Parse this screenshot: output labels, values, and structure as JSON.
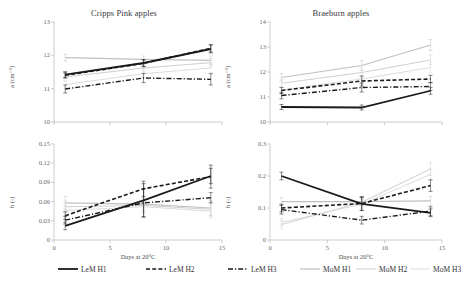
{
  "figure": {
    "background": "#ffffff",
    "colors": {
      "dark": "#1a1a1a",
      "light_gray": "#c8c8c8",
      "mid_gray": "#b4b4b4",
      "pale_gray": "#d8d8d8",
      "axis": "#bfbfbf",
      "text": "#3a3a3a"
    }
  },
  "legend": {
    "position": "bottom",
    "items": [
      {
        "label": "LeM H1",
        "style": "solid",
        "color": "#1a1a1a",
        "width": 1.8
      },
      {
        "label": "LeM H2",
        "style": "dashed",
        "color": "#1a1a1a",
        "width": 1.6
      },
      {
        "label": "LeM H3",
        "style": "dashdot",
        "color": "#1a1a1a",
        "width": 1.4
      },
      {
        "label": "MoM H1",
        "style": "solid",
        "color": "#c0c0c0",
        "width": 1.2
      },
      {
        "label": "MoM H2",
        "style": "solid",
        "color": "#cfcfcf",
        "width": 1.0
      },
      {
        "label": "MoM H3",
        "style": "solid",
        "color": "#dcdcdc",
        "width": 1.0
      }
    ]
  },
  "chart_data": [
    {
      "id": "cripps-pink-a",
      "type": "line",
      "title": "Cripps Pink apples",
      "xlabel": "",
      "ylabel": "a (cm⁻¹)",
      "x": [
        1,
        8,
        14
      ],
      "xlim": [
        0,
        15
      ],
      "ylim": [
        10,
        13
      ],
      "xticks": [
        0,
        5,
        10,
        15
      ],
      "yticks": [
        10,
        11,
        12,
        13
      ],
      "xticklabels": [
        "0",
        "5",
        "10",
        "15"
      ],
      "yticklabels": [
        "10",
        "11",
        "12",
        "13"
      ],
      "show_xticklabels": false,
      "grid": false,
      "series": [
        {
          "name": "LeM H1",
          "style": "solid",
          "color": "#1a1a1a",
          "width": 1.8,
          "values": [
            11.42,
            11.77,
            12.19
          ],
          "errors": [
            0.09,
            0.1,
            0.12
          ]
        },
        {
          "name": "LeM H2",
          "style": "dashed",
          "color": "#1a1a1a",
          "width": 1.6,
          "values": [
            11.4,
            11.76,
            12.21
          ],
          "errors": [
            0.08,
            0.1,
            0.11
          ]
        },
        {
          "name": "LeM H3",
          "style": "dashdot",
          "color": "#1a1a1a",
          "width": 1.4,
          "values": [
            10.99,
            11.32,
            11.28
          ],
          "errors": [
            0.12,
            0.14,
            0.17
          ]
        },
        {
          "name": "MoM H1",
          "style": "solid",
          "color": "#c0c0c0",
          "width": 1.2,
          "values": [
            11.93,
            11.88,
            11.85
          ],
          "errors": [
            0.1,
            0.1,
            0.13
          ]
        },
        {
          "name": "MoM H2",
          "style": "solid",
          "color": "#cfcfcf",
          "width": 1.0,
          "values": [
            11.35,
            11.62,
            11.78
          ],
          "errors": [
            0.1,
            0.1,
            0.12
          ]
        },
        {
          "name": "MoM H3",
          "style": "solid",
          "color": "#dcdcdc",
          "width": 1.0,
          "values": [
            11.12,
            11.45,
            11.62
          ],
          "errors": [
            0.1,
            0.12,
            0.14
          ]
        }
      ]
    },
    {
      "id": "braeburn-a",
      "type": "line",
      "title": "Braeburn apples",
      "xlabel": "",
      "ylabel": "a (cm⁻¹)",
      "x": [
        1,
        8,
        14
      ],
      "xlim": [
        0,
        15
      ],
      "ylim": [
        10,
        14
      ],
      "xticks": [
        0,
        5,
        10,
        15
      ],
      "yticks": [
        10,
        11,
        12,
        13,
        14
      ],
      "xticklabels": [
        "0",
        "5",
        "10",
        "15"
      ],
      "yticklabels": [
        "10",
        "11",
        "12",
        "13",
        "14"
      ],
      "show_xticklabels": false,
      "grid": false,
      "series": [
        {
          "name": "LeM H1",
          "style": "solid",
          "color": "#1a1a1a",
          "width": 1.8,
          "values": [
            10.6,
            10.58,
            11.25
          ],
          "errors": [
            0.1,
            0.1,
            0.14
          ]
        },
        {
          "name": "LeM H2",
          "style": "dashed",
          "color": "#1a1a1a",
          "width": 1.6,
          "values": [
            11.26,
            11.64,
            11.72
          ],
          "errors": [
            0.12,
            0.2,
            0.15
          ]
        },
        {
          "name": "LeM H3",
          "style": "dashdot",
          "color": "#1a1a1a",
          "width": 1.4,
          "values": [
            11.06,
            11.38,
            11.42
          ],
          "errors": [
            0.13,
            0.18,
            0.16
          ]
        },
        {
          "name": "MoM H1",
          "style": "solid",
          "color": "#c0c0c0",
          "width": 1.2,
          "values": [
            11.78,
            12.26,
            13.08
          ],
          "errors": [
            0.15,
            0.2,
            0.22
          ]
        },
        {
          "name": "MoM H2",
          "style": "solid",
          "color": "#cfcfcf",
          "width": 1.0,
          "values": [
            11.55,
            11.98,
            12.48
          ],
          "errors": [
            0.14,
            0.18,
            0.2
          ]
        },
        {
          "name": "MoM H3",
          "style": "solid",
          "color": "#dcdcdc",
          "width": 1.0,
          "values": [
            11.28,
            11.72,
            12.18
          ],
          "errors": [
            0.14,
            0.18,
            0.2
          ]
        }
      ]
    },
    {
      "id": "cripps-pink-b",
      "type": "line",
      "title": "",
      "xlabel": "Days at 20°C",
      "ylabel": "b (-)",
      "x": [
        1,
        8,
        14
      ],
      "xlim": [
        0,
        15
      ],
      "ylim": [
        0,
        0.15
      ],
      "xticks": [
        0,
        5,
        10,
        15
      ],
      "yticks": [
        0,
        0.03,
        0.06,
        0.09,
        0.12,
        0.15
      ],
      "xticklabels": [
        "0",
        "5",
        "10",
        "15"
      ],
      "yticklabels": [
        "0",
        "0.03",
        "0.06",
        "0.09",
        "0.12",
        "0.15"
      ],
      "show_xticklabels": true,
      "grid": false,
      "series": [
        {
          "name": "LeM H1",
          "style": "solid",
          "color": "#1a1a1a",
          "width": 1.8,
          "values": [
            0.022,
            0.062,
            0.1
          ],
          "errors": [
            0.006,
            0.026,
            0.012
          ]
        },
        {
          "name": "LeM H2",
          "style": "dashed",
          "color": "#1a1a1a",
          "width": 1.6,
          "values": [
            0.038,
            0.08,
            0.099
          ],
          "errors": [
            0.006,
            0.012,
            0.018
          ]
        },
        {
          "name": "LeM H3",
          "style": "dashdot",
          "color": "#1a1a1a",
          "width": 1.4,
          "values": [
            0.031,
            0.058,
            0.066
          ],
          "errors": [
            0.006,
            0.022,
            0.008
          ]
        },
        {
          "name": "MoM H1",
          "style": "solid",
          "color": "#c0c0c0",
          "width": 1.2,
          "values": [
            0.058,
            0.056,
            0.05
          ],
          "errors": [
            0.01,
            0.01,
            0.012
          ]
        },
        {
          "name": "MoM H2",
          "style": "solid",
          "color": "#cfcfcf",
          "width": 1.0,
          "values": [
            0.052,
            0.054,
            0.048
          ],
          "errors": [
            0.009,
            0.01,
            0.011
          ]
        },
        {
          "name": "MoM H3",
          "style": "solid",
          "color": "#dcdcdc",
          "width": 1.0,
          "values": [
            0.046,
            0.052,
            0.045
          ],
          "errors": [
            0.008,
            0.01,
            0.011
          ]
        }
      ]
    },
    {
      "id": "braeburn-b",
      "type": "line",
      "title": "",
      "xlabel": "Days at 20°C",
      "ylabel": "b (-)",
      "x": [
        1,
        8,
        14
      ],
      "xlim": [
        0,
        15
      ],
      "ylim": [
        0,
        0.3
      ],
      "xticks": [
        0,
        5,
        10,
        15
      ],
      "yticks": [
        0,
        0.1,
        0.2,
        0.3
      ],
      "xticklabels": [
        "0",
        "5",
        "10",
        "15"
      ],
      "yticklabels": [
        "0",
        "0.1",
        "0.2",
        "0.3"
      ],
      "show_xticklabels": true,
      "grid": false,
      "series": [
        {
          "name": "LeM H1",
          "style": "solid",
          "color": "#1a1a1a",
          "width": 1.8,
          "values": [
            0.2,
            0.113,
            0.085
          ],
          "errors": [
            0.012,
            0.02,
            0.012
          ]
        },
        {
          "name": "LeM H2",
          "style": "dashed",
          "color": "#1a1a1a",
          "width": 1.6,
          "values": [
            0.1,
            0.114,
            0.17
          ],
          "errors": [
            0.012,
            0.022,
            0.018
          ]
        },
        {
          "name": "LeM H3",
          "style": "dashdot",
          "color": "#1a1a1a",
          "width": 1.4,
          "values": [
            0.095,
            0.062,
            0.09
          ],
          "errors": [
            0.014,
            0.012,
            0.014
          ]
        },
        {
          "name": "MoM H1",
          "style": "solid",
          "color": "#c0c0c0",
          "width": 1.2,
          "values": [
            0.12,
            0.12,
            0.122
          ],
          "errors": [
            0.012,
            0.012,
            0.014
          ]
        },
        {
          "name": "MoM H2",
          "style": "solid",
          "color": "#cfcfcf",
          "width": 1.0,
          "values": [
            0.048,
            0.118,
            0.222
          ],
          "errors": [
            0.014,
            0.014,
            0.02
          ]
        },
        {
          "name": "MoM H3",
          "style": "solid",
          "color": "#dcdcdc",
          "width": 1.0,
          "values": [
            0.055,
            0.112,
            0.205
          ],
          "errors": [
            0.012,
            0.014,
            0.018
          ]
        }
      ]
    }
  ]
}
